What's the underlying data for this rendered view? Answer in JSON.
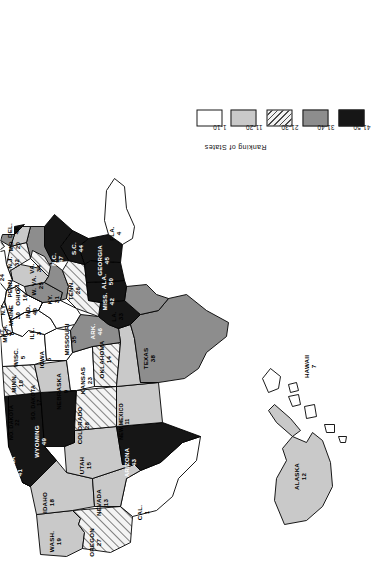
{
  "figure": {
    "kind": "choropleth-map",
    "orientation": "rotated 90 degrees counter-clockwise on the page"
  },
  "legend": {
    "title": "Ranking of States",
    "classes": [
      {
        "label": "1-10",
        "fill": "white",
        "hex": "#ffffff"
      },
      {
        "label": "11-20",
        "fill": "light-gray",
        "hex": "#c9c9c9"
      },
      {
        "label": "21-30",
        "fill": "diagonal-hatch",
        "hex": "#f2f2f2"
      },
      {
        "label": "31-40",
        "fill": "medium-gray",
        "hex": "#8d8d8d"
      },
      {
        "label": "41-50",
        "fill": "black",
        "hex": "#161616"
      }
    ]
  },
  "chart_data": {
    "type": "map",
    "title": "Ranking of States",
    "value_name": "rank",
    "bins": [
      "1-10",
      "11-20",
      "21-30",
      "31-40",
      "41-50"
    ],
    "states": [
      {
        "name": "CAL.",
        "rank": 1,
        "bin": "1-10"
      },
      {
        "name": "N.Y.",
        "rank": 2,
        "bin": "1-10"
      },
      {
        "name": "ILL.",
        "rank": 3,
        "bin": "1-10"
      },
      {
        "name": "FLA.",
        "rank": 4,
        "bin": "1-10"
      },
      {
        "name": "WISC.",
        "rank": 5,
        "bin": "1-10"
      },
      {
        "name": "IOWA",
        "rank": 6,
        "bin": "1-10"
      },
      {
        "name": "HAWAII",
        "rank": 7,
        "bin": "1-10"
      },
      {
        "name": "MICH.",
        "rank": 8,
        "bin": "1-10"
      },
      {
        "name": "NEBRASKA",
        "rank": 9,
        "bin": "1-10"
      },
      {
        "name": "MINN.",
        "rank": 10,
        "bin": "1-10"
      },
      {
        "name": "NEW MEXICO",
        "rank": 11,
        "bin": "11-20"
      },
      {
        "name": "ALASKA",
        "rank": 12,
        "bin": "11-20"
      },
      {
        "name": "NEVADA",
        "rank": 13,
        "bin": "11-20"
      },
      {
        "name": "OKLAHOMA",
        "rank": 14,
        "bin": "11-20"
      },
      {
        "name": "UTAH",
        "rank": 15,
        "bin": "11-20"
      },
      {
        "name": "OHIO",
        "rank": 16,
        "bin": "11-20"
      },
      {
        "name": "SO. DAKOTA",
        "rank": 17,
        "bin": "11-20"
      },
      {
        "name": "IDAHO",
        "rank": 18,
        "bin": "11-20"
      },
      {
        "name": "WASH.",
        "rank": 19,
        "bin": "11-20"
      },
      {
        "name": "MD.",
        "rank": 20,
        "bin": "11-20"
      },
      {
        "name": "PENN.",
        "rank": 21,
        "bin": "21-30"
      },
      {
        "name": "NO. DAKOTA",
        "rank": 22,
        "bin": "21-30"
      },
      {
        "name": "KANSAS",
        "rank": 23,
        "bin": "21-30"
      },
      {
        "name": "CONN.",
        "rank": 24,
        "bin": "21-30"
      },
      {
        "name": "W. VA.",
        "rank": 25,
        "bin": "21-30"
      },
      {
        "name": "TENN.",
        "rank": 26,
        "bin": "21-30"
      },
      {
        "name": "OREGON",
        "rank": 27,
        "bin": "21-30"
      },
      {
        "name": "COLORADO",
        "rank": 28,
        "bin": "21-30"
      },
      {
        "name": "MASS",
        "rank": 29,
        "bin": "21-30"
      },
      {
        "name": "MAINE",
        "rank": 30,
        "bin": "21-30"
      },
      {
        "name": "KY.",
        "rank": 31,
        "bin": "31-40"
      },
      {
        "name": "N.J.",
        "rank": 32,
        "bin": "31-40"
      },
      {
        "name": "LA.",
        "rank": 33,
        "bin": "31-40"
      },
      {
        "name": "VA.",
        "rank": 34,
        "bin": "31-40"
      },
      {
        "name": "MISSOURI",
        "rank": 35,
        "bin": "31-40"
      },
      {
        "name": "R.I.",
        "rank": 36,
        "bin": "31-40"
      },
      {
        "name": "VT.",
        "rank": 37,
        "bin": "31-40"
      },
      {
        "name": "TEXAS",
        "rank": 38,
        "bin": "31-40"
      },
      {
        "name": "N.H.",
        "rank": 39,
        "bin": "31-40"
      },
      {
        "name": "IND.",
        "rank": 40,
        "bin": "31-40"
      },
      {
        "name": "MONTANA",
        "rank": 41,
        "bin": "41-50"
      },
      {
        "name": "MISS.",
        "rank": 42,
        "bin": "41-50"
      },
      {
        "name": "ARIZONA",
        "rank": 43,
        "bin": "41-50"
      },
      {
        "name": "S.C.",
        "rank": 44,
        "bin": "41-50"
      },
      {
        "name": "GEORGIA",
        "rank": 45,
        "bin": "41-50"
      },
      {
        "name": "ARK.",
        "rank": 46,
        "bin": "41-50"
      },
      {
        "name": "N.C.",
        "rank": 47,
        "bin": "41-50"
      },
      {
        "name": "DEL.",
        "rank": 48,
        "bin": "41-50"
      },
      {
        "name": "WYOMING",
        "rank": 49,
        "bin": "41-50"
      },
      {
        "name": "ALA.",
        "rank": 50,
        "bin": "41-50"
      }
    ]
  },
  "labels": [
    {
      "name": "WASH.",
      "rank": "19",
      "x": 41,
      "y": 55,
      "rot": 0,
      "dark": false
    },
    {
      "name": "OREGON",
      "rank": 27,
      "x": 40,
      "y": 95,
      "rot": 0,
      "dark": false
    },
    {
      "name": "CAL.",
      "rank": 1,
      "x": 70,
      "y": 143,
      "rot": 0,
      "dark": false
    },
    {
      "name": "IDAHO",
      "rank": 18,
      "x": 80,
      "y": 48,
      "rot": 0,
      "dark": false
    },
    {
      "name": "NEVADA",
      "rank": 13,
      "x": 80,
      "y": 102,
      "rot": 0,
      "dark": false
    },
    {
      "name": "UTAH",
      "rank": 15,
      "x": 117,
      "y": 85,
      "rot": 0,
      "dark": false
    },
    {
      "name": "ARIZONA",
      "rank": 43,
      "x": 120,
      "y": 130,
      "rot": 0,
      "dark": true
    },
    {
      "name": "MONTANA",
      "rank": 41,
      "x": 110,
      "y": 16,
      "rot": 0,
      "dark": true
    },
    {
      "name": "WYOMING",
      "rank": 49,
      "x": 141,
      "y": 40,
      "rot": 0,
      "dark": true
    },
    {
      "name": "COLORADO",
      "rank": 28,
      "x": 157,
      "y": 83,
      "rot": 0,
      "dark": false
    },
    {
      "name": "NEW MEXICO",
      "rank": 11,
      "x": 161,
      "y": 124,
      "rot": 0,
      "dark": false
    },
    {
      "name": "NO. DAKOTA",
      "rank": 22,
      "x": 160,
      "y": 14,
      "rot": 0,
      "dark": false
    },
    {
      "name": "SO. DAKOTA",
      "rank": 17,
      "x": 180,
      "y": 36,
      "rot": 0,
      "dark": false
    },
    {
      "name": "NEBRASKA",
      "rank": 9,
      "x": 191,
      "y": 62,
      "rot": 0,
      "dark": false
    },
    {
      "name": "KANSAS",
      "rank": 23,
      "x": 202,
      "y": 86,
      "rot": 0,
      "dark": false
    },
    {
      "name": "OKLAHOMA",
      "rank": 14,
      "x": 223,
      "y": 105,
      "rot": 0,
      "dark": false
    },
    {
      "name": "TEXAS",
      "rank": 38,
      "x": 224,
      "y": 149,
      "rot": 0,
      "dark": false
    },
    {
      "name": "MINN.",
      "rank": 10,
      "x": 199,
      "y": 17,
      "rot": 0,
      "dark": false
    },
    {
      "name": "IOWA",
      "rank": 6,
      "x": 223,
      "y": 45,
      "rot": 0,
      "dark": false
    },
    {
      "name": "MISSOURI",
      "rank": 35,
      "x": 243,
      "y": 70,
      "rot": 0,
      "dark": false
    },
    {
      "name": "ARK.",
      "rank": 46,
      "x": 251,
      "y": 96,
      "rot": 0,
      "dark": true
    },
    {
      "name": "LA.",
      "rank": 33,
      "x": 266,
      "y": 117,
      "rot": 0,
      "dark": false
    },
    {
      "name": "WISC.",
      "rank": 5,
      "x": 225,
      "y": 19,
      "rot": 0,
      "dark": false
    },
    {
      "name": "ILL.",
      "rank": 3,
      "x": 249,
      "y": 35,
      "rot": 0,
      "dark": false
    },
    {
      "name": "MICH.",
      "rank": 8,
      "x": 249,
      "y": 8,
      "rot": 0,
      "dark": false
    },
    {
      "name": "IND.",
      "rank": 40,
      "x": 271,
      "y": 31,
      "rot": 0,
      "dark": false
    },
    {
      "name": "OHIO",
      "rank": 16,
      "x": 285,
      "y": 21,
      "rot": 0,
      "dark": false
    },
    {
      "name": "KY.",
      "rank": 31,
      "x": 283,
      "y": 53,
      "rot": 0,
      "dark": false
    },
    {
      "name": "TENN.",
      "rank": 26,
      "x": 292,
      "y": 74,
      "rot": 0,
      "dark": false
    },
    {
      "name": "MISS.",
      "rank": 42,
      "x": 281,
      "y": 108,
      "rot": 0,
      "dark": true
    },
    {
      "name": "ALA.",
      "rank": 50,
      "x": 301,
      "y": 107,
      "rot": 0,
      "dark": true
    },
    {
      "name": "GEORGIA",
      "rank": 45,
      "x": 322,
      "y": 103,
      "rot": 0,
      "dark": true
    },
    {
      "name": "FLA.",
      "rank": 4,
      "x": 349,
      "y": 115,
      "rot": 0,
      "dark": false
    },
    {
      "name": "S.C.",
      "rank": 44,
      "x": 334,
      "y": 77,
      "rot": 0,
      "dark": true
    },
    {
      "name": "N.C.",
      "rank": 47,
      "x": 323,
      "y": 57,
      "rot": 0,
      "dark": true
    },
    {
      "name": "W. VA.",
      "rank": 25,
      "x": 297,
      "y": 37,
      "rot": 0,
      "dark": false
    },
    {
      "name": "VA.",
      "rank": 34,
      "x": 314,
      "y": 35,
      "rot": 0,
      "dark": false
    },
    {
      "name": "PENN.",
      "rank": 21,
      "x": 295,
      "y": 13,
      "rot": 0,
      "dark": false
    },
    {
      "name": "N.Y.",
      "rank": 2,
      "x": 273,
      "y": 6,
      "rot": 0,
      "dark": false
    },
    {
      "name": "MD.",
      "rank": 20,
      "x": 337,
      "y": 14,
      "rot": 0,
      "dark": false
    },
    {
      "name": "DEL.",
      "rank": 48,
      "x": 352,
      "y": 13,
      "rot": 0,
      "dark": false
    },
    {
      "name": "N.J.",
      "rank": 32,
      "x": 320,
      "y": 13,
      "rot": 0,
      "dark": false
    },
    {
      "name": "CONN.",
      "rank": 24,
      "x": 305,
      "y": -2,
      "rot": 0,
      "dark": false
    },
    {
      "name": "R.I.",
      "rank": 36,
      "x": 292,
      "y": -9,
      "rot": 0,
      "dark": false
    },
    {
      "name": "MASS",
      "rank": 29,
      "x": 281,
      "y": -10,
      "rot": 0,
      "dark": false
    },
    {
      "name": "N.H.",
      "rank": 39,
      "x": 264,
      "y": -8,
      "rot": 0,
      "dark": false
    },
    {
      "name": "VT.",
      "rank": 37,
      "x": 250,
      "y": 5,
      "rot": 0,
      "dark": false
    },
    {
      "name": "MAINE",
      "rank": 30,
      "x": 267,
      "y": 14,
      "rot": 0,
      "dark": false
    },
    {
      "name": "ALASKA",
      "rank": 12,
      "x": 106,
      "y": 300,
      "rot": 0,
      "dark": false
    },
    {
      "name": "HAWAII",
      "rank": 7,
      "x": 216,
      "y": 310,
      "rot": 0,
      "dark": false
    }
  ]
}
